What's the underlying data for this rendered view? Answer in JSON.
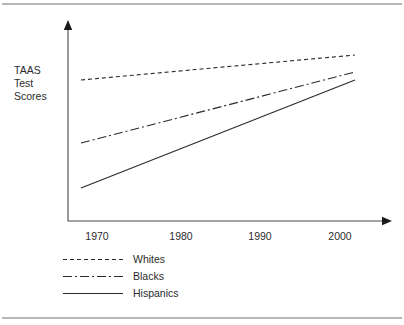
{
  "figure": {
    "width": 404,
    "height": 325,
    "background": "#ffffff",
    "rule_color": "#6f6f6f",
    "top_rule_y": 4,
    "bottom_rule_y": 318
  },
  "axis": {
    "origin_x": 68,
    "origin_y": 221,
    "y_top": 20,
    "x_right": 392,
    "color": "#4a4a4a",
    "arrow_color": "#1a1a1a"
  },
  "ylabel": {
    "lines": [
      "TAAS",
      "Test",
      "Scores"
    ],
    "x": 14,
    "y_start": 74,
    "line_height": 13
  },
  "xticks": {
    "labels": [
      "1970",
      "1980",
      "1990",
      "2000"
    ],
    "x_positions": [
      97,
      181,
      260,
      340
    ],
    "y": 240
  },
  "legend": {
    "swatch_x1": 63,
    "swatch_x2": 123,
    "text_x": 133,
    "rows_y": [
      263,
      280,
      297
    ],
    "items": [
      {
        "label": "Whites",
        "style": "dashed",
        "dasharray": "4,3"
      },
      {
        "label": "Blacks",
        "style": "dash-dot",
        "dasharray": "9,3,2,3"
      },
      {
        "label": "Hispanics",
        "style": "solid",
        "dasharray": "none"
      }
    ]
  },
  "chart_data": {
    "type": "line",
    "title": "",
    "subtitle": "",
    "xlabel": "",
    "ylabel": "TAAS Test Scores",
    "xticks": [
      "1970",
      "1980",
      "1990",
      "2000"
    ],
    "yticks": [],
    "grid": false,
    "legend_position": "below",
    "x": [
      1968,
      2004
    ],
    "xlim": [
      1966,
      2006
    ],
    "ylim": [
      0,
      100
    ],
    "axis_note": "Y axis is unlabeled/qualitative; values are schematic relative positions.",
    "series": [
      {
        "name": "Whites",
        "style": "dashed",
        "x": [
          1968,
          2004
        ],
        "values": [
          70,
          82.5
        ],
        "pixel_points": [
          [
            81,
            80
          ],
          [
            355,
            55
          ]
        ]
      },
      {
        "name": "Blacks",
        "style": "dash-dot",
        "x": [
          1968,
          2004
        ],
        "values": [
          39,
          74
        ],
        "pixel_points": [
          [
            81,
            143
          ],
          [
            355,
            72
          ]
        ]
      },
      {
        "name": "Hispanics",
        "style": "solid",
        "x": [
          1968,
          2004
        ],
        "values": [
          16.5,
          70
        ],
        "pixel_points": [
          [
            81,
            188
          ],
          [
            355,
            80
          ]
        ]
      }
    ],
    "annotations": []
  }
}
